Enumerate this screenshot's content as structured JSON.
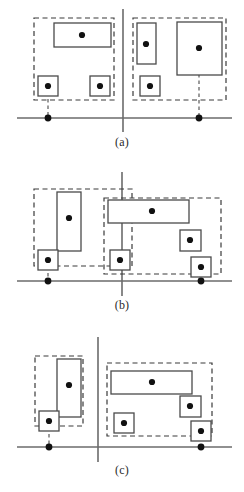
{
  "figure": {
    "title": "",
    "width": 244,
    "height": 492,
    "background": "#ffffff",
    "stroke_solid": "#4a4a4a",
    "stroke_dashed": "#3a3a3a",
    "axis_color": "#6b6b6b",
    "point_color": "#111111",
    "leader_color": "#4a4a4a"
  },
  "panels": [
    {
      "id": "a",
      "label": "(a)",
      "label_name": "panel-a-label",
      "axis": {
        "horizontal": {
          "x1": 17,
          "y": 118,
          "x2": 232
        },
        "vertical": {
          "x": 123,
          "y1": 9,
          "y2": 132
        }
      },
      "groups": [
        {
          "name": "group-a-left",
          "box": {
            "x": 34,
            "y": 18,
            "w": 80,
            "h": 82
          }
        },
        {
          "name": "group-a-right",
          "box": {
            "x": 133,
            "y": 18,
            "w": 93,
            "h": 82
          }
        }
      ],
      "rects": [
        {
          "name": "rect-a-1",
          "x": 54,
          "y": 23,
          "w": 57,
          "h": 24
        },
        {
          "name": "rect-a-2",
          "x": 38,
          "y": 76,
          "w": 20,
          "h": 20
        },
        {
          "name": "rect-a-3",
          "x": 90,
          "y": 76,
          "w": 20,
          "h": 20
        },
        {
          "name": "rect-a-4",
          "x": 137,
          "y": 23,
          "w": 19,
          "h": 41
        },
        {
          "name": "rect-a-5",
          "x": 140,
          "y": 76,
          "w": 20,
          "h": 20
        },
        {
          "name": "rect-a-6",
          "x": 177,
          "y": 22,
          "w": 45,
          "h": 53
        }
      ],
      "points": [
        {
          "name": "point-a-1",
          "x": 82,
          "y": 35
        },
        {
          "name": "point-a-2",
          "x": 48,
          "y": 86
        },
        {
          "name": "point-a-3",
          "x": 100,
          "y": 86
        },
        {
          "name": "point-a-4",
          "x": 146,
          "y": 44
        },
        {
          "name": "point-a-5",
          "x": 150,
          "y": 86
        },
        {
          "name": "point-a-6",
          "x": 199,
          "y": 48
        }
      ],
      "axis_points": [
        {
          "name": "axis-point-a-1",
          "x": 48,
          "y": 118
        },
        {
          "name": "axis-point-a-2",
          "x": 199,
          "y": 118
        }
      ],
      "leaders": [
        {
          "name": "leader-a-1",
          "x": 48,
          "y1": 86,
          "y2": 118
        },
        {
          "name": "leader-a-2",
          "x": 199,
          "y1": 48,
          "y2": 118
        }
      ]
    },
    {
      "id": "b",
      "label": "(b)",
      "label_name": "panel-b-label",
      "axis": {
        "horizontal": {
          "x1": 17,
          "y": 281,
          "x2": 232
        },
        "vertical": {
          "x": 122,
          "y1": 172,
          "y2": 296
        }
      },
      "groups": [
        {
          "name": "group-b-left",
          "box": {
            "x": 34,
            "y": 189,
            "w": 98,
            "h": 77
          }
        },
        {
          "name": "group-b-right",
          "box": {
            "x": 104,
            "y": 198,
            "w": 117,
            "h": 76
          }
        }
      ],
      "rects": [
        {
          "name": "rect-b-1",
          "x": 57,
          "y": 192,
          "w": 24,
          "h": 59
        },
        {
          "name": "rect-b-2",
          "x": 38,
          "y": 250,
          "w": 20,
          "h": 20
        },
        {
          "name": "rect-b-3",
          "x": 108,
          "y": 200,
          "w": 81,
          "h": 23
        },
        {
          "name": "rect-b-4",
          "x": 110,
          "y": 250,
          "w": 20,
          "h": 20
        },
        {
          "name": "rect-b-5",
          "x": 180,
          "y": 230,
          "w": 21,
          "h": 21
        },
        {
          "name": "rect-b-6",
          "x": 191,
          "y": 257,
          "w": 20,
          "h": 20
        }
      ],
      "points": [
        {
          "name": "point-b-1",
          "x": 69,
          "y": 218
        },
        {
          "name": "point-b-2",
          "x": 48,
          "y": 260
        },
        {
          "name": "point-b-3",
          "x": 152,
          "y": 211
        },
        {
          "name": "point-b-4",
          "x": 120,
          "y": 260
        },
        {
          "name": "point-b-5",
          "x": 190,
          "y": 240
        },
        {
          "name": "point-b-6",
          "x": 201,
          "y": 267
        }
      ],
      "axis_points": [
        {
          "name": "axis-point-b-1",
          "x": 48,
          "y": 281
        },
        {
          "name": "axis-point-b-2",
          "x": 201,
          "y": 281
        }
      ],
      "leaders": [
        {
          "name": "leader-b-1",
          "x": 48,
          "y1": 260,
          "y2": 281
        },
        {
          "name": "leader-b-2",
          "x": 201,
          "y1": 267,
          "y2": 281
        }
      ]
    },
    {
      "id": "c",
      "label": "(c)",
      "label_name": "panel-c-label",
      "axis": {
        "horizontal": {
          "x1": 17,
          "y": 447,
          "x2": 232
        },
        "vertical": {
          "x": 98,
          "y1": 337,
          "y2": 462
        }
      },
      "groups": [
        {
          "name": "group-c-left",
          "box": {
            "x": 35,
            "y": 356,
            "w": 48,
            "h": 70
          }
        },
        {
          "name": "group-c-right",
          "box": {
            "x": 107,
            "y": 363,
            "w": 105,
            "h": 73
          }
        }
      ],
      "rects": [
        {
          "name": "rect-c-1",
          "x": 57,
          "y": 359,
          "w": 24,
          "h": 58
        },
        {
          "name": "rect-c-2",
          "x": 39,
          "y": 411,
          "w": 20,
          "h": 20
        },
        {
          "name": "rect-c-3",
          "x": 111,
          "y": 371,
          "w": 81,
          "h": 23
        },
        {
          "name": "rect-c-4",
          "x": 114,
          "y": 413,
          "w": 20,
          "h": 20
        },
        {
          "name": "rect-c-5",
          "x": 180,
          "y": 396,
          "w": 21,
          "h": 21
        },
        {
          "name": "rect-c-6",
          "x": 191,
          "y": 421,
          "w": 20,
          "h": 20
        }
      ],
      "points": [
        {
          "name": "point-c-1",
          "x": 69,
          "y": 385
        },
        {
          "name": "point-c-2",
          "x": 49,
          "y": 421
        },
        {
          "name": "point-c-3",
          "x": 152,
          "y": 382
        },
        {
          "name": "point-c-4",
          "x": 124,
          "y": 423
        },
        {
          "name": "point-c-5",
          "x": 190,
          "y": 406
        },
        {
          "name": "point-c-6",
          "x": 201,
          "y": 431
        }
      ],
      "axis_points": [
        {
          "name": "axis-point-c-1",
          "x": 49,
          "y": 447
        },
        {
          "name": "axis-point-c-2",
          "x": 201,
          "y": 447
        }
      ],
      "leaders": [
        {
          "name": "leader-c-1",
          "x": 49,
          "y1": 421,
          "y2": 447
        },
        {
          "name": "leader-c-2",
          "x": 201,
          "y1": 431,
          "y2": 447
        }
      ]
    }
  ],
  "chart_data": {
    "type": "diagram",
    "title": "",
    "panel_labels": [
      "(a)",
      "(b)",
      "(c)"
    ],
    "legend": [],
    "grid": false
  }
}
